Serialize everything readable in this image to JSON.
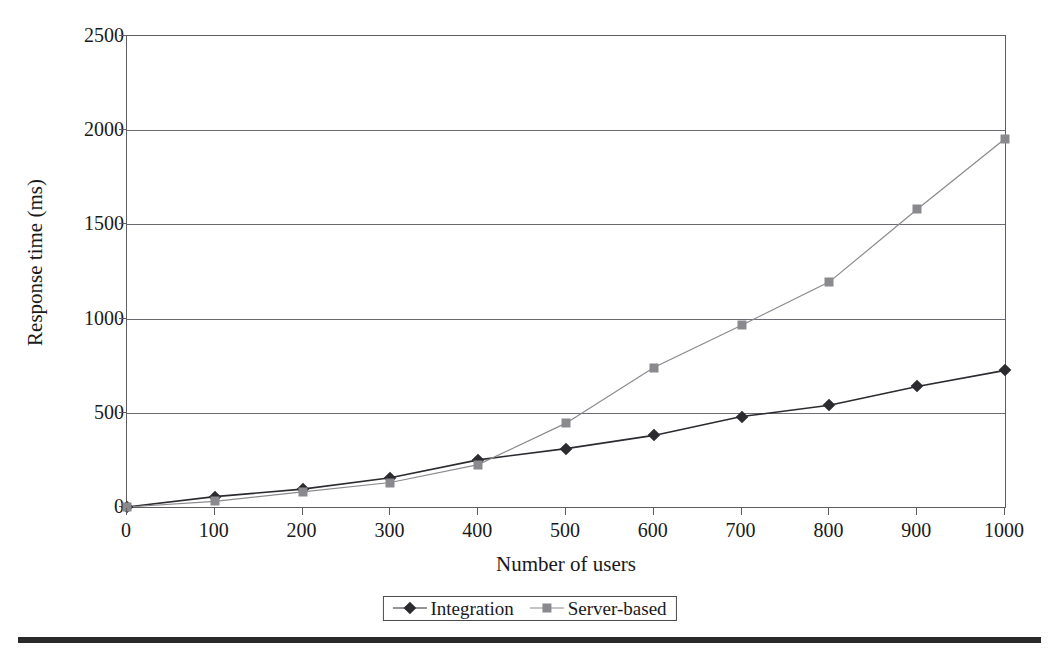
{
  "clipped_top_text": "",
  "chart_data": {
    "type": "line",
    "title": "",
    "xlabel": "Number of users",
    "ylabel": "Response time (ms)",
    "x": [
      0,
      100,
      200,
      300,
      400,
      500,
      600,
      700,
      800,
      900,
      1000
    ],
    "xticks": [
      "0",
      "100",
      "200",
      "300",
      "400",
      "500",
      "600",
      "700",
      "800",
      "900",
      "1000"
    ],
    "yticks": [
      "0",
      "500",
      "1000",
      "1500",
      "2000",
      "2500"
    ],
    "xlim": [
      0,
      1000
    ],
    "ylim": [
      0,
      2500
    ],
    "grid": "horizontal",
    "legend_position": "bottom-center",
    "series": [
      {
        "name": "Integration",
        "marker": "diamond",
        "color": "#2b2b30",
        "values": [
          0,
          55,
          95,
          155,
          250,
          310,
          380,
          480,
          540,
          640,
          725
        ]
      },
      {
        "name": "Server-based",
        "marker": "square",
        "color": "#8a8a8e",
        "values": [
          0,
          30,
          80,
          130,
          225,
          445,
          740,
          965,
          1195,
          1580,
          1955
        ]
      }
    ]
  },
  "legend": {
    "entries": [
      {
        "label": "Integration"
      },
      {
        "label": "Server-based"
      }
    ]
  },
  "caption": {
    "label": "",
    "text": ""
  }
}
